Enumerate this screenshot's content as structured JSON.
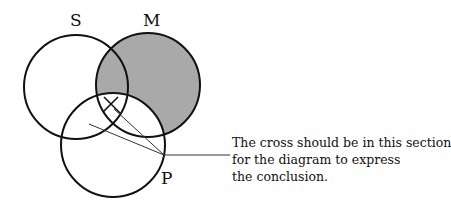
{
  "diagram": {
    "type": "venn",
    "circles": [
      {
        "label": "S",
        "cx": 76,
        "cy": 87,
        "r": 52
      },
      {
        "label": "M",
        "cx": 148,
        "cy": 85,
        "r": 52
      },
      {
        "label": "P",
        "cx": 113,
        "cy": 145,
        "r": 52
      }
    ],
    "shaded_region": "M outside P",
    "shade_color": "#a9a9a9",
    "cross_mark": "X",
    "annotation": {
      "lines": [
        "The cross should be in this section",
        "for the diagram to express",
        "the conclusion."
      ]
    }
  }
}
